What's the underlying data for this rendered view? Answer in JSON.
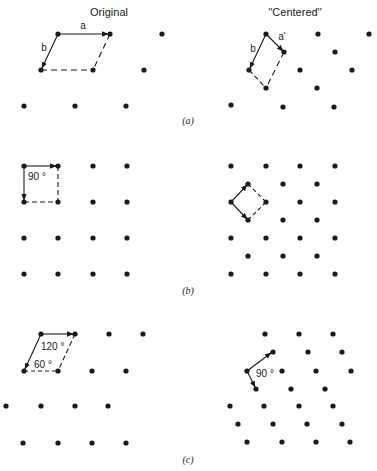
{
  "headers": {
    "left": "Original",
    "right": "''Centered''"
  },
  "panels": [
    {
      "caption": "(a)",
      "left": {
        "vector_labels": {
          "a": "a",
          "b": "b"
        },
        "dots": [
          [
            58,
            34
          ],
          [
            110,
            34
          ],
          [
            162,
            34
          ],
          [
            41,
            70
          ],
          [
            93,
            70
          ],
          [
            144,
            70
          ],
          [
            24,
            106
          ],
          [
            75,
            106
          ],
          [
            126,
            106
          ]
        ],
        "cell": {
          "origin": [
            58,
            34
          ],
          "a_end": [
            110,
            34
          ],
          "b_end": [
            41,
            70
          ],
          "far": [
            93,
            70
          ]
        }
      },
      "right": {
        "vector_labels": {
          "a": "a'",
          "b": "b"
        },
        "dots": [
          [
            266,
            34
          ],
          [
            318,
            34
          ],
          [
            369,
            34
          ],
          [
            284,
            52
          ],
          [
            335,
            52
          ],
          [
            249,
            70
          ],
          [
            300,
            70
          ],
          [
            352,
            70
          ],
          [
            266,
            88
          ],
          [
            317,
            88
          ],
          [
            231,
            105
          ],
          [
            283,
            107
          ],
          [
            334,
            107
          ]
        ],
        "cell": {
          "origin": [
            266,
            34
          ],
          "a_end": [
            284,
            52
          ],
          "b_end": [
            249,
            70
          ],
          "far": [
            266,
            88
          ]
        }
      }
    },
    {
      "caption": "(b)",
      "left": {
        "angle_label": "90 °",
        "dots": [
          [
            24,
            166
          ],
          [
            58,
            166
          ],
          [
            93,
            166
          ],
          [
            127,
            166
          ],
          [
            24,
            202
          ],
          [
            58,
            202
          ],
          [
            93,
            202
          ],
          [
            127,
            202
          ],
          [
            24,
            238
          ],
          [
            58,
            238
          ],
          [
            93,
            238
          ],
          [
            127,
            238
          ],
          [
            24,
            274
          ],
          [
            58,
            274
          ],
          [
            93,
            274
          ],
          [
            127,
            274
          ]
        ],
        "cell": {
          "origin": [
            24,
            166
          ],
          "a_end": [
            58,
            166
          ],
          "b_end": [
            24,
            202
          ],
          "far": [
            58,
            202
          ]
        }
      },
      "right": {
        "dots": [
          [
            231,
            166
          ],
          [
            266,
            166
          ],
          [
            300,
            166
          ],
          [
            335,
            166
          ],
          [
            248,
            184
          ],
          [
            283,
            184
          ],
          [
            317,
            184
          ],
          [
            231,
            202
          ],
          [
            266,
            202
          ],
          [
            300,
            202
          ],
          [
            335,
            202
          ],
          [
            248,
            220
          ],
          [
            283,
            220
          ],
          [
            317,
            220
          ],
          [
            231,
            238
          ],
          [
            266,
            238
          ],
          [
            300,
            238
          ],
          [
            335,
            238
          ],
          [
            248,
            256
          ],
          [
            283,
            256
          ],
          [
            317,
            256
          ],
          [
            231,
            274
          ],
          [
            266,
            274
          ],
          [
            300,
            274
          ],
          [
            335,
            274
          ]
        ],
        "cell": {
          "origin": [
            231,
            202
          ],
          "a_end": [
            248,
            184
          ],
          "b_end": [
            248,
            220
          ],
          "far": [
            266,
            202
          ]
        }
      }
    },
    {
      "caption": "(c)",
      "left": {
        "angle_labels": {
          "obtuse": "120 °",
          "acute": "60 °"
        },
        "dots": [
          [
            41,
            334
          ],
          [
            75,
            334
          ],
          [
            109,
            334
          ],
          [
            143,
            334
          ],
          [
            24,
            371
          ],
          [
            58,
            371
          ],
          [
            92,
            371
          ],
          [
            126,
            371
          ],
          [
            6,
            406
          ],
          [
            41,
            406
          ],
          [
            75,
            406
          ],
          [
            108,
            406
          ],
          [
            23,
            443
          ],
          [
            58,
            443
          ],
          [
            92,
            443
          ],
          [
            126,
            443
          ]
        ],
        "cell": {
          "origin": [
            41,
            334
          ],
          "a_end": [
            75,
            334
          ],
          "b_end": [
            24,
            371
          ],
          "far": [
            58,
            371
          ]
        }
      },
      "right": {
        "angle_label": "90 °",
        "dots": [
          [
            265,
            334
          ],
          [
            299,
            334
          ],
          [
            333,
            334
          ],
          [
            273,
            352
          ],
          [
            308,
            352
          ],
          [
            342,
            352
          ],
          [
            247,
            371
          ],
          [
            282,
            371
          ],
          [
            316,
            371
          ],
          [
            351,
            371
          ],
          [
            256,
            389
          ],
          [
            291,
            389
          ],
          [
            325,
            389
          ],
          [
            230,
            406
          ],
          [
            264,
            406
          ],
          [
            299,
            406
          ],
          [
            333,
            406
          ],
          [
            238,
            424
          ],
          [
            273,
            424
          ],
          [
            307,
            424
          ],
          [
            342,
            424
          ],
          [
            247,
            442
          ],
          [
            282,
            442
          ],
          [
            316,
            442
          ],
          [
            350,
            442
          ]
        ],
        "cell": {
          "origin": [
            247,
            371
          ],
          "a_end": [
            273,
            352
          ],
          "b_end": [
            256,
            389
          ]
        }
      }
    }
  ],
  "colors": {
    "ink": "#1a1a1a",
    "background": "#ffffff"
  }
}
